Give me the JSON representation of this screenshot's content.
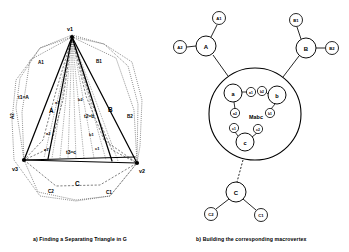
{
  "figure": {
    "caption_a": "a) Finding a Separating Triangle in G",
    "caption_b": "b) Building the corresponding macrovertex"
  },
  "panel_a": {
    "title": "Finding a Separating Triangle in G",
    "vertices": [
      {
        "id": "v1",
        "label": "v1",
        "x": 72,
        "y": 37
      },
      {
        "id": "v3",
        "label": "v3",
        "x": 24,
        "y": 160
      },
      {
        "id": "v2",
        "label": "v2",
        "x": 137,
        "y": 163
      }
    ],
    "region_labels": [
      {
        "id": "A1",
        "label": "A1",
        "x": 41,
        "y": 62
      },
      {
        "id": "A2",
        "label": "A2",
        "x": 17,
        "y": 116
      },
      {
        "id": "B1",
        "label": "B1",
        "x": 99,
        "y": 61
      },
      {
        "id": "B2",
        "label": "B2",
        "x": 129,
        "y": 116
      },
      {
        "id": "C1",
        "label": "C1",
        "x": 110,
        "y": 192
      },
      {
        "id": "C2",
        "label": "C2",
        "x": 52,
        "y": 191
      },
      {
        "id": "A",
        "label": "A",
        "x": 52,
        "y": 110
      },
      {
        "id": "B",
        "label": "B",
        "x": 110,
        "y": 109
      },
      {
        "id": "C",
        "label": "C",
        "x": 78,
        "y": 183
      }
    ],
    "triangle_labels": [
      {
        "id": "t1",
        "label": "t1=A",
        "x": 25,
        "y": 97
      },
      {
        "id": "t2",
        "label": "t2=b",
        "x": 92,
        "y": 116
      },
      {
        "id": "t3",
        "label": "t3=c",
        "x": 74,
        "y": 152
      }
    ],
    "edge_labels": [
      {
        "id": "a1",
        "label": "a1",
        "x": 58,
        "y": 103
      },
      {
        "id": "a2",
        "label": "a2",
        "x": 49,
        "y": 133
      },
      {
        "id": "a1b",
        "label": "a1",
        "x": 47,
        "y": 149
      },
      {
        "id": "b2",
        "label": "b2",
        "x": 81,
        "y": 99
      },
      {
        "id": "b1",
        "label": "b1",
        "x": 92,
        "y": 134
      },
      {
        "id": "c1",
        "label": "c1",
        "x": 98,
        "y": 148
      }
    ]
  },
  "panel_b": {
    "title": "Building the corresponding macrovertex",
    "macrovertex": {
      "label": "Mabc",
      "label_x": 256,
      "label_y": 117,
      "cx": 255,
      "cy": 114,
      "r": 46
    },
    "inner_nodes": [
      {
        "id": "a",
        "label": "a",
        "x": 233,
        "y": 93,
        "r": 9
      },
      {
        "id": "b",
        "label": "b",
        "x": 277,
        "y": 95,
        "r": 9
      },
      {
        "id": "c",
        "label": "c",
        "x": 245,
        "y": 142,
        "r": 9
      }
    ],
    "inner_small_nodes": [
      {
        "id": "a1",
        "label": "a1",
        "x": 251,
        "y": 92,
        "r": 4.6
      },
      {
        "id": "a2",
        "label": "a2",
        "x": 235,
        "y": 113,
        "r": 4.6
      },
      {
        "id": "b2",
        "label": "b2",
        "x": 262,
        "y": 91,
        "r": 4.6
      },
      {
        "id": "b1",
        "label": "b1",
        "x": 270,
        "y": 113,
        "r": 4.6
      },
      {
        "id": "c1",
        "label": "c1",
        "x": 234,
        "y": 128,
        "r": 4.6
      },
      {
        "id": "c2",
        "label": "c2",
        "x": 258,
        "y": 129,
        "r": 4.6
      }
    ],
    "outer_nodes": [
      {
        "id": "A",
        "label": "A",
        "x": 206,
        "y": 46,
        "r": 10
      },
      {
        "id": "B",
        "label": "B",
        "x": 306,
        "y": 48,
        "r": 10
      },
      {
        "id": "C",
        "label": "C",
        "x": 236,
        "y": 192,
        "r": 10
      }
    ],
    "leaf_nodes": [
      {
        "id": "A1",
        "label": "A1",
        "x": 219,
        "y": 18,
        "r": 6.5
      },
      {
        "id": "A2",
        "label": "A2",
        "x": 180,
        "y": 47,
        "r": 6.5
      },
      {
        "id": "B1",
        "label": "B1",
        "x": 296,
        "y": 20,
        "r": 6.5
      },
      {
        "id": "B2",
        "label": "B2",
        "x": 332,
        "y": 48,
        "r": 6.5
      },
      {
        "id": "C1",
        "label": "C1",
        "x": 261,
        "y": 215,
        "r": 6.5
      },
      {
        "id": "C2",
        "label": "C2",
        "x": 211,
        "y": 214,
        "r": 6.5
      }
    ]
  },
  "colors": {
    "stroke": "#000000",
    "fill": "#ffffff",
    "background": "#ffffff"
  }
}
